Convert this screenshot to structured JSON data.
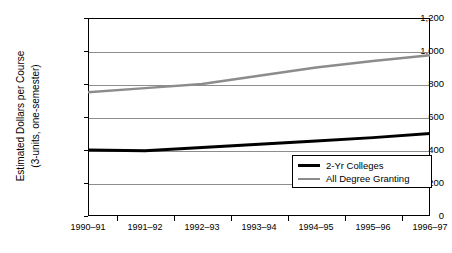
{
  "chart_data": {
    "type": "line",
    "title": "",
    "xlabel": "",
    "ylabel": "Estimated Dollars per Course (3-units, one-semester)",
    "ylabel_lines": [
      "Estimated Dollars per Course",
      "(3-units, one-semester)"
    ],
    "categories": [
      "1990–91",
      "1991–92",
      "1992–93",
      "1993–94",
      "1994–95",
      "1995–96",
      "1996–97"
    ],
    "ylim": [
      0,
      1200
    ],
    "yticks": [
      0,
      200,
      400,
      600,
      800,
      1000,
      1200
    ],
    "ytick_labels": [
      "0",
      "200",
      "400",
      "600",
      "800",
      "1,000",
      "1,200"
    ],
    "grid": true,
    "legend_position": "inside-bottom-right",
    "series": [
      {
        "name": "2-Yr Colleges",
        "color": "#000000",
        "width": 3,
        "values": [
          400,
          395,
          415,
          435,
          455,
          475,
          500
        ]
      },
      {
        "name": "All Degree Granting",
        "color": "#8c8c8c",
        "width": 2.5,
        "values": [
          750,
          775,
          800,
          850,
          900,
          940,
          975
        ]
      }
    ]
  },
  "legend": {
    "items": [
      {
        "label": "2-Yr Colleges",
        "swatch": "black-line-swatch"
      },
      {
        "label": "All Degree Granting",
        "swatch": "gray-line-swatch"
      }
    ]
  }
}
